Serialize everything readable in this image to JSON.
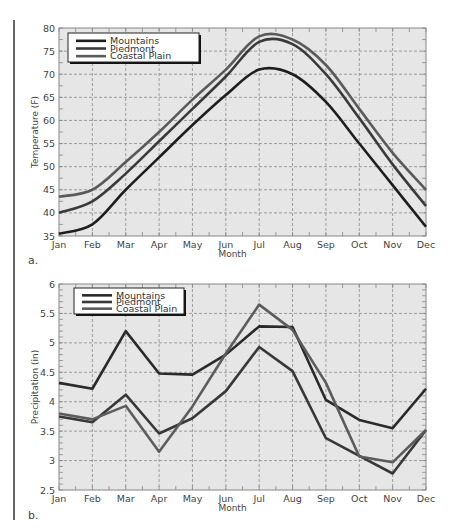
{
  "chart_data": [
    {
      "type": "line",
      "panel_label": "a.",
      "title": "",
      "xlabel": "Month",
      "ylabel": "Temperature (F)",
      "ylim": [
        35,
        80
      ],
      "yticks": [
        35,
        40,
        45,
        50,
        55,
        60,
        65,
        70,
        75,
        80
      ],
      "grid": true,
      "legend_position": "upper left",
      "categories": [
        "Jan",
        "Feb",
        "Mar",
        "Apr",
        "May",
        "Jun",
        "Jul",
        "Aug",
        "Sep",
        "Oct",
        "Nov",
        "Dec"
      ],
      "series": [
        {
          "name": "Mountains",
          "color": "#1e1e1e",
          "values": [
            35.5,
            37.5,
            45,
            52,
            59,
            65.5,
            71,
            70,
            64,
            55,
            46,
            37
          ]
        },
        {
          "name": "Piedmont",
          "color": "#3a3a3a",
          "values": [
            40,
            42.5,
            48.5,
            55.5,
            62.5,
            69.5,
            77,
            76.5,
            70,
            60.5,
            50.5,
            41.5
          ]
        },
        {
          "name": "Coastal Plain",
          "color": "#5a5a5a",
          "values": [
            43.5,
            45,
            51,
            57.5,
            64.5,
            71,
            78.2,
            77.5,
            72,
            62.5,
            53,
            45
          ]
        }
      ]
    },
    {
      "type": "line",
      "panel_label": "b.",
      "title": "",
      "xlabel": "Month",
      "ylabel": "Precipitation (in)",
      "ylim": [
        2.5,
        6
      ],
      "yticks": [
        2.5,
        3,
        3.5,
        4,
        4.5,
        5,
        5.5,
        6
      ],
      "grid": true,
      "legend_position": "upper left",
      "categories": [
        "Jan",
        "Feb",
        "Mar",
        "Apr",
        "May",
        "Jun",
        "Jul",
        "Aug",
        "Sep",
        "Oct",
        "Nov",
        "Dec"
      ],
      "series": [
        {
          "name": "Mountains",
          "color": "#2a2a2a",
          "values": [
            4.32,
            4.22,
            5.2,
            4.48,
            4.46,
            4.8,
            5.28,
            5.27,
            4.03,
            3.69,
            3.55,
            4.22
          ]
        },
        {
          "name": "Piedmont",
          "color": "#383838",
          "values": [
            3.75,
            3.65,
            4.12,
            3.46,
            3.72,
            4.18,
            4.93,
            4.52,
            3.38,
            3.08,
            2.78,
            3.52
          ]
        },
        {
          "name": "Coastal Plain",
          "color": "#5c5c5c",
          "values": [
            3.8,
            3.7,
            3.93,
            3.15,
            3.92,
            4.82,
            5.65,
            5.22,
            4.32,
            3.07,
            2.97,
            3.52
          ]
        }
      ]
    }
  ]
}
